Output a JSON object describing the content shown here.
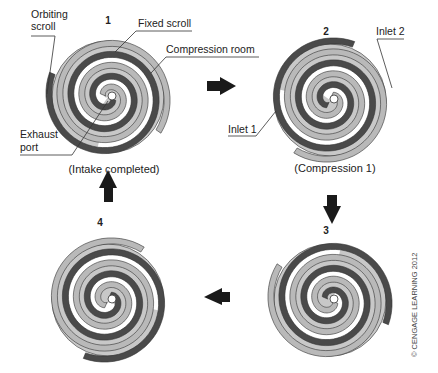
{
  "figure": {
    "stages": [
      {
        "number": "1",
        "caption": "(Intake completed)",
        "rotation_deg": 0
      },
      {
        "number": "2",
        "caption": "(Compression 1)",
        "rotation_deg": 90
      },
      {
        "number": "3",
        "caption": "",
        "rotation_deg": 180
      },
      {
        "number": "4",
        "caption": "",
        "rotation_deg": 270
      }
    ],
    "labels": {
      "orbiting_scroll_line1": "Orbiting",
      "orbiting_scroll_line2": "scroll",
      "fixed_scroll": "Fixed scroll",
      "compression_room": "Compression room",
      "exhaust_port_line1": "Exhaust",
      "exhaust_port_line2": "port",
      "inlet_1": "Inlet 1",
      "inlet_2": "Inlet 2"
    },
    "flow_arrows": [
      {
        "from": "1",
        "to": "2",
        "direction": "right"
      },
      {
        "from": "2",
        "to": "3",
        "direction": "down"
      },
      {
        "from": "3",
        "to": "4",
        "direction": "left"
      },
      {
        "from": "4",
        "to": "1",
        "direction": "up"
      }
    ],
    "copyright": "© CENGAGE LEARNING 2012",
    "colors": {
      "orbiting_scroll": "#4a4a4a",
      "fixed_scroll": "#b9b9b9",
      "compression_fill": "#c8c8c8",
      "outline": "#333333",
      "arrow": "#1a1a1a"
    }
  }
}
